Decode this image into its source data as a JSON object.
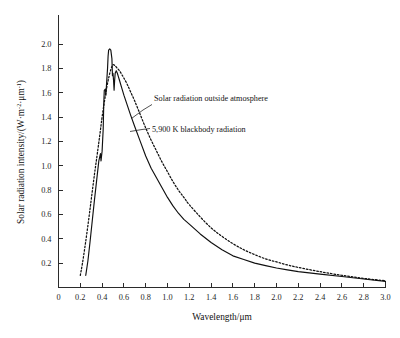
{
  "chart_data": {
    "type": "line",
    "title": "",
    "xlabel": "Wavelength/μm",
    "ylabel": "Solar radiation intensity/(W·m⁻²·μm⁻¹)",
    "ylabel_parts": {
      "main": "Solar radiation intensity/(W",
      "dot1": "·",
      "unit_m": "m",
      "exp_m": "-2",
      "dot2": "·",
      "unit_um": "μm",
      "exp_um": "-1",
      "close": ")"
    },
    "xlim": [
      0,
      3.0
    ],
    "ylim": [
      0,
      2.1
    ],
    "grid": false,
    "legend_position": "inline-annotations",
    "xticks": [
      0,
      0.2,
      0.4,
      0.6,
      0.8,
      1.0,
      1.2,
      1.4,
      1.6,
      1.8,
      2.0,
      2.2,
      2.4,
      2.6,
      2.8,
      3.0
    ],
    "xtick_labels": [
      "0",
      "0.2",
      "0.4",
      "0.6",
      "0.8",
      "1.0",
      "1.2",
      "1.4",
      "1.6",
      "1.8",
      "2.0",
      "2.2",
      "2.4",
      "2.6",
      "2.8",
      "3.0"
    ],
    "yticks": [
      0.2,
      0.4,
      0.6,
      0.8,
      1.0,
      1.2,
      1.4,
      1.6,
      1.8,
      2.0
    ],
    "ytick_labels": [
      "0.2",
      "0.4",
      "0.6",
      "0.8",
      "1.0",
      "1.2",
      "1.4",
      "1.6",
      "1.8",
      "2.0"
    ],
    "series": [
      {
        "name": "Solar radiation outside atmosphere",
        "style": "solid",
        "color": "#101010",
        "peak": {
          "x": 0.47,
          "y": 1.95
        },
        "x": [
          0.25,
          0.27,
          0.29,
          0.31,
          0.33,
          0.35,
          0.37,
          0.385,
          0.39,
          0.4,
          0.41,
          0.415,
          0.42,
          0.43,
          0.435,
          0.44,
          0.45,
          0.455,
          0.46,
          0.47,
          0.48,
          0.49,
          0.495,
          0.5,
          0.505,
          0.51,
          0.515,
          0.52,
          0.53,
          0.54,
          0.55,
          0.56,
          0.58,
          0.6,
          0.63,
          0.66,
          0.7,
          0.75,
          0.8,
          0.85,
          0.9,
          0.95,
          1.0,
          1.05,
          1.1,
          1.15,
          1.2,
          1.3,
          1.4,
          1.5,
          1.6,
          1.7,
          1.8,
          1.9,
          2.0,
          2.1,
          2.2,
          2.4,
          2.6,
          2.8,
          3.0
        ],
        "y": [
          0.1,
          0.22,
          0.38,
          0.55,
          0.72,
          0.88,
          1.04,
          1.1,
          1.04,
          1.12,
          1.3,
          1.5,
          1.62,
          1.63,
          1.58,
          1.66,
          1.8,
          1.9,
          1.95,
          1.96,
          1.95,
          1.88,
          1.74,
          1.76,
          1.7,
          1.62,
          1.7,
          1.76,
          1.78,
          1.76,
          1.73,
          1.7,
          1.64,
          1.58,
          1.5,
          1.42,
          1.32,
          1.2,
          1.08,
          0.98,
          0.9,
          0.82,
          0.74,
          0.67,
          0.61,
          0.56,
          0.52,
          0.44,
          0.37,
          0.31,
          0.26,
          0.23,
          0.2,
          0.18,
          0.16,
          0.145,
          0.13,
          0.11,
          0.09,
          0.07,
          0.05
        ]
      },
      {
        "name": "5,900 K blackbody radiation",
        "style": "dashed",
        "color": "#101010",
        "peak": {
          "x": 0.5,
          "y": 1.83
        },
        "x": [
          0.2,
          0.22,
          0.25,
          0.28,
          0.3,
          0.33,
          0.35,
          0.38,
          0.4,
          0.42,
          0.44,
          0.46,
          0.48,
          0.5,
          0.52,
          0.54,
          0.56,
          0.58,
          0.6,
          0.63,
          0.66,
          0.7,
          0.75,
          0.8,
          0.85,
          0.9,
          0.95,
          1.0,
          1.05,
          1.1,
          1.15,
          1.2,
          1.3,
          1.4,
          1.5,
          1.6,
          1.7,
          1.8,
          1.9,
          2.0,
          2.1,
          2.2,
          2.4,
          2.6,
          2.8,
          3.0
        ],
        "y": [
          0.1,
          0.2,
          0.38,
          0.58,
          0.72,
          0.93,
          1.06,
          1.26,
          1.4,
          1.52,
          1.63,
          1.72,
          1.79,
          1.83,
          1.82,
          1.8,
          1.78,
          1.75,
          1.72,
          1.67,
          1.61,
          1.53,
          1.42,
          1.31,
          1.21,
          1.12,
          1.03,
          0.95,
          0.87,
          0.8,
          0.74,
          0.68,
          0.58,
          0.49,
          0.42,
          0.36,
          0.31,
          0.27,
          0.235,
          0.21,
          0.185,
          0.165,
          0.13,
          0.1,
          0.075,
          0.055
        ]
      }
    ],
    "annotations": [
      {
        "text": "Solar radiation outside atmosphere",
        "target_series": "Solar radiation outside atmosphere"
      },
      {
        "text": "5,900 K blackbody radiation",
        "target_series": "5,900 K blackbody radiation"
      }
    ]
  }
}
